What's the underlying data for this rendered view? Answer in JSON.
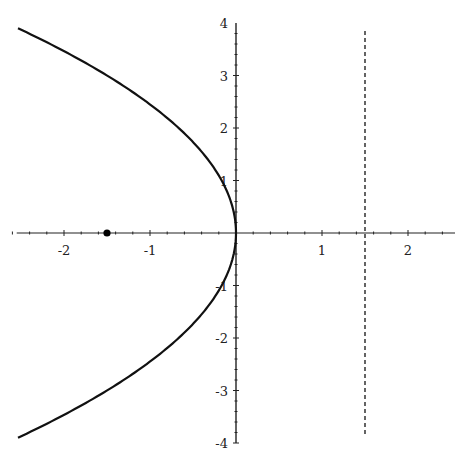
{
  "chart_data": {
    "type": "line",
    "title": "",
    "xlabel": "",
    "ylabel": "",
    "xlim": [
      -2.55,
      2.5
    ],
    "ylim": [
      -4,
      4
    ],
    "grid": false,
    "legend": null,
    "x_ticks": [
      -2,
      -1,
      1,
      2
    ],
    "x_tick_labels": [
      "-2",
      "-1",
      "1",
      "2"
    ],
    "y_ticks": [
      -4,
      -3,
      -2,
      -1,
      1,
      2,
      3,
      4
    ],
    "y_tick_labels": [
      "-4",
      "-3",
      "-2",
      "-1",
      "1",
      "2",
      "3",
      "4"
    ],
    "series": [
      {
        "name": "parabola y^2 = -6x",
        "style": "solid",
        "color": "#111111",
        "equation": "x = -y^2/6",
        "y_range": [
          -3.9,
          3.9
        ],
        "points": [
          {
            "x": -2.535,
            "y": 3.9
          },
          {
            "x": -1.5,
            "y": 3.0
          },
          {
            "x": -0.667,
            "y": 2.0
          },
          {
            "x": -0.167,
            "y": 1.0
          },
          {
            "x": 0,
            "y": 0
          },
          {
            "x": -0.167,
            "y": -1.0
          },
          {
            "x": -0.667,
            "y": -2.0
          },
          {
            "x": -1.5,
            "y": -3.0
          },
          {
            "x": -2.535,
            "y": -3.9
          }
        ]
      },
      {
        "name": "directrix",
        "style": "dashed",
        "color": "#111111",
        "x": 1.5,
        "y_range": [
          -3.85,
          3.85
        ]
      }
    ],
    "annotations": [
      {
        "type": "point",
        "name": "focus",
        "x": -1.5,
        "y": 0,
        "color": "#000000"
      }
    ]
  }
}
